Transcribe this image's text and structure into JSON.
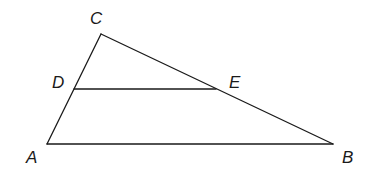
{
  "diagram": {
    "type": "triangle-with-parallel-segment",
    "points": {
      "A": {
        "label": "A",
        "x": 47,
        "y": 144,
        "lx": 26,
        "ly": 163
      },
      "B": {
        "label": "B",
        "x": 333,
        "y": 144,
        "lx": 342,
        "ly": 163
      },
      "C": {
        "label": "C",
        "x": 101,
        "y": 34,
        "lx": 90,
        "ly": 24
      },
      "D": {
        "label": "D",
        "x": 74,
        "y": 89,
        "lx": 52,
        "ly": 88
      },
      "E": {
        "label": "E",
        "x": 216,
        "y": 89,
        "lx": 229,
        "ly": 88
      }
    },
    "segments": [
      {
        "name": "segment-AB",
        "from": "A",
        "to": "B"
      },
      {
        "name": "segment-BC",
        "from": "B",
        "to": "C"
      },
      {
        "name": "segment-CA",
        "from": "C",
        "to": "A"
      },
      {
        "name": "segment-DE",
        "from": "D",
        "to": "E"
      }
    ],
    "colors": {
      "stroke": "#1a1a1a",
      "background": "#ffffff"
    }
  }
}
